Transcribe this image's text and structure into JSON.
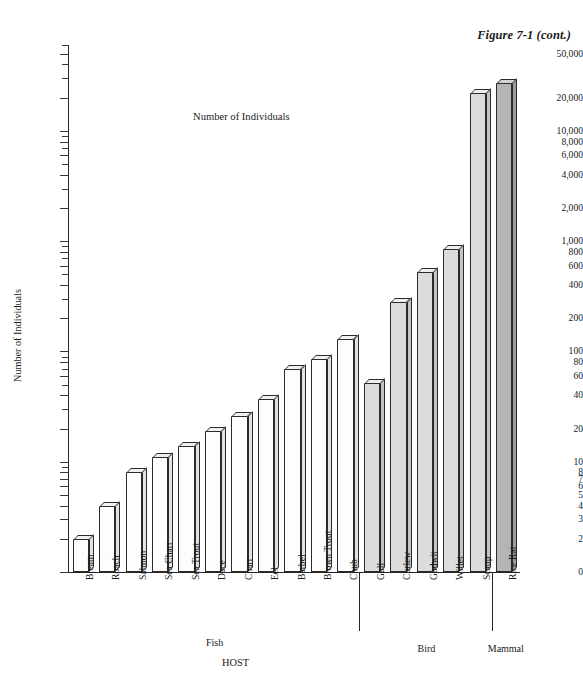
{
  "figure": {
    "caption": "Figure 7-1 (cont.)"
  },
  "chart_data": {
    "type": "bar",
    "title": "Number of Individuals",
    "xlabel": "HOST",
    "ylabel": "Number of Individuals",
    "yscale": "log",
    "ylim": [
      1,
      60000
    ],
    "grid": false,
    "legend": "none",
    "categories": [
      "Bream",
      "Roach",
      "Salmon",
      "Sea Charr",
      "Sea Trout",
      "Dace",
      "Charr",
      "Eel",
      "Barbel",
      "Brown Trout",
      "Chub",
      "Gull",
      "Curlew",
      "Godwit",
      "Willet",
      "Scaup",
      "Rice Rat"
    ],
    "values": [
      2,
      4,
      8,
      11,
      14,
      19,
      26,
      37,
      70,
      86,
      130,
      52,
      280,
      520,
      850,
      22000,
      27000
    ],
    "groups": [
      {
        "name": "Fish",
        "label": "Fish",
        "count": 11,
        "fill": "#fdfdfd"
      },
      {
        "name": "Bird",
        "label": "Bird",
        "count": 5,
        "fill": "#dcdcdc"
      },
      {
        "name": "Mammal",
        "label": "Mammal",
        "count": 1,
        "fill": "#b4b4b4"
      }
    ],
    "ytick_labels": [
      "50,000",
      "20,000",
      "10,000",
      "8,000",
      "6,000",
      "4,000",
      "2,000",
      "1,000",
      "800",
      "600",
      "400",
      "200",
      "100",
      "80",
      "60",
      "40",
      "20",
      "10",
      "8",
      "7",
      "6",
      "5",
      "4",
      "3",
      "2",
      "0"
    ],
    "ytick_values": [
      50000,
      20000,
      10000,
      8000,
      6000,
      4000,
      2000,
      1000,
      800,
      600,
      400,
      200,
      100,
      80,
      60,
      40,
      20,
      10,
      8,
      7,
      6,
      5,
      4,
      3,
      2,
      0
    ]
  }
}
